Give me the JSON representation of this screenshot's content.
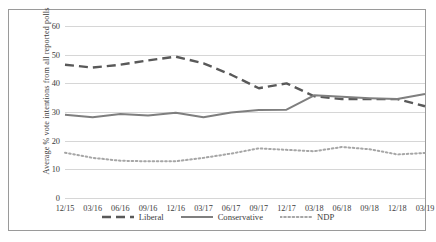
{
  "chart_data": {
    "type": "line",
    "title": "",
    "xlabel": "",
    "ylabel": "Average % vote intentions from all reported polls",
    "ylim": [
      0,
      60
    ],
    "ytick_step": 10,
    "yticks": [
      "0",
      "10",
      "20",
      "30",
      "40",
      "50",
      "60"
    ],
    "grid": true,
    "legend_position": "bottom",
    "categories": [
      "12/15",
      "03/16",
      "06/16",
      "09/16",
      "12/16",
      "03/17",
      "06/17",
      "09/17",
      "12/17",
      "03/18",
      "06/18",
      "09/18",
      "12/18",
      "03/19"
    ],
    "series": [
      {
        "name": "Liberal",
        "style": "dashed",
        "color": "#595959",
        "values": [
          46.5,
          45.5,
          46.5,
          48.0,
          49.3,
          47.0,
          43.0,
          38.3,
          40.0,
          35.5,
          34.5,
          34.5,
          34.5,
          32.0
        ]
      },
      {
        "name": "Conservative",
        "style": "solid",
        "color": "#7f7f7f",
        "values": [
          29.0,
          28.2,
          29.3,
          28.8,
          29.7,
          28.2,
          29.8,
          30.7,
          30.8,
          35.8,
          35.3,
          34.8,
          34.5,
          36.3
        ]
      },
      {
        "name": "NDP",
        "style": "dotted",
        "color": "#a6a6a6",
        "values": [
          15.8,
          14.0,
          13.0,
          12.8,
          12.8,
          14.0,
          15.5,
          17.3,
          16.8,
          16.3,
          17.8,
          17.0,
          15.2,
          15.7
        ]
      }
    ]
  },
  "legend": {
    "entries": [
      {
        "label": "Liberal"
      },
      {
        "label": "Conservative"
      },
      {
        "label": "NDP"
      }
    ]
  }
}
